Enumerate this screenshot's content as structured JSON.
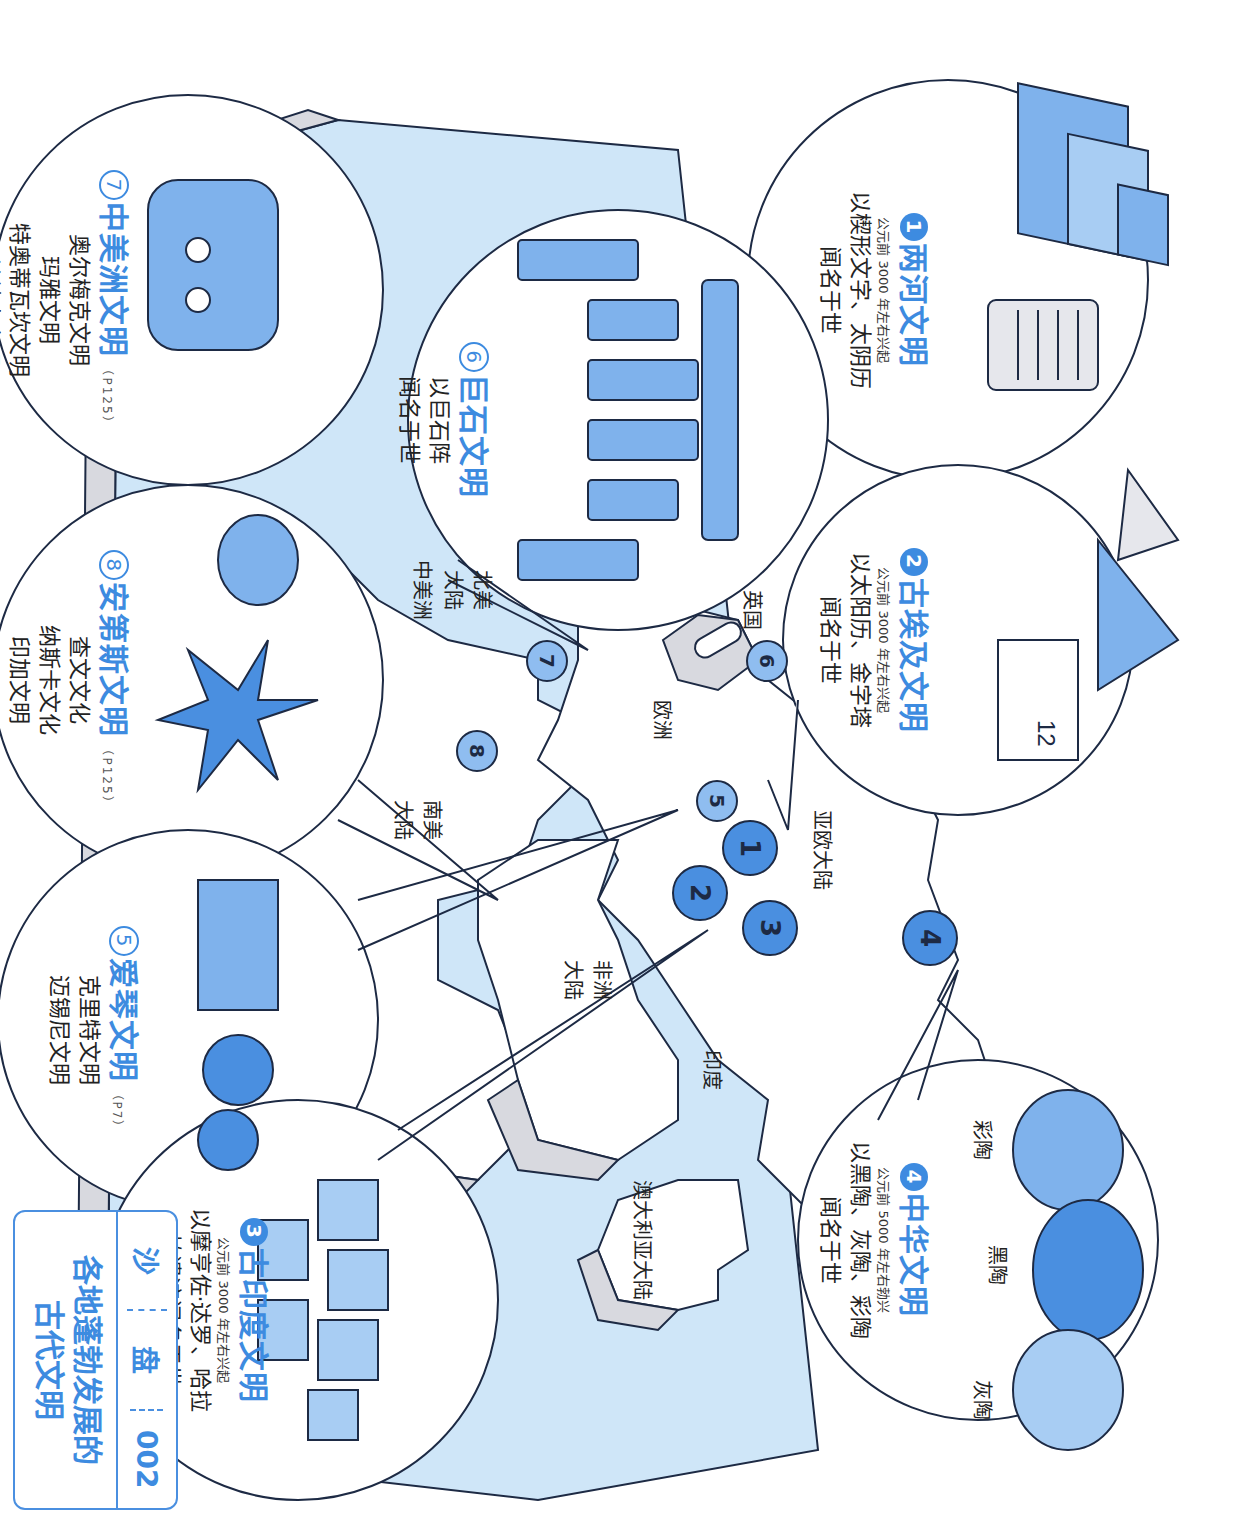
{
  "title_card": {
    "series": [
      "沙",
      "盘",
      "002"
    ],
    "title_line1": "各地蓬勃发展的",
    "title_line2": "古代文明"
  },
  "civilizations": [
    {
      "num": "1",
      "num_style": "filled",
      "name": "两河文明",
      "date": "公元前 3000 年左右兴起",
      "desc": [
        "以楔形文字、太阴历",
        "闻名于世"
      ],
      "ref": ""
    },
    {
      "num": "2",
      "num_style": "filled",
      "name": "古埃及文明",
      "date": "公元前 3000 年左右兴起",
      "desc": [
        "以太阳历、金字塔",
        "闻名于世"
      ],
      "ref": ""
    },
    {
      "num": "3",
      "num_style": "filled",
      "name": "古印度文明",
      "date": "公元前 3000 年左右兴起",
      "desc": [
        "以摩亨佐·达罗、哈拉",
        "帕遗迹闻名于世"
      ],
      "ref": ""
    },
    {
      "num": "4",
      "num_style": "filled",
      "name": "中华文明",
      "date": "公元前 5000 年左右勃兴",
      "desc": [
        "以黑陶、灰陶、彩陶",
        "闻名于世"
      ],
      "ref": "",
      "pottery_labels": [
        "彩陶",
        "黑陶",
        "灰陶"
      ]
    },
    {
      "num": "5",
      "num_style": "ring",
      "name": "爱琴文明",
      "date": "",
      "desc": [
        "克里特文明",
        "迈锡尼文明"
      ],
      "ref": "（P7）"
    },
    {
      "num": "6",
      "num_style": "ring",
      "name": "巨石文明",
      "date": "",
      "desc": [
        "以巨石阵",
        "闻名于世"
      ],
      "ref": ""
    },
    {
      "num": "7",
      "num_style": "ring",
      "name": "中美洲文明",
      "date": "",
      "desc": [
        "奥尔梅克文明",
        "玛雅文明",
        "特奥蒂瓦坎文明",
        "阿兹特克文明"
      ],
      "ref": "（P125）"
    },
    {
      "num": "8",
      "num_style": "ring",
      "name": "安第斯文明",
      "date": "",
      "desc": [
        "查文文化",
        "纳斯卡文化",
        "印加文明"
      ],
      "ref": "（P125）"
    }
  ],
  "map_labels": {
    "eurasia": "亚欧大陆",
    "europe": "欧洲",
    "india": "印度",
    "africa_1": "非洲",
    "africa_2": "大陆",
    "australia": "澳大利亚大陆",
    "north_america_1": "北美",
    "north_america_2": "大陆",
    "central_america": "中美洲",
    "south_america_1": "南美",
    "south_america_2": "大陆",
    "uk": "英国"
  },
  "pins": [
    {
      "num": "1",
      "tone": "dark"
    },
    {
      "num": "2",
      "tone": "dark"
    },
    {
      "num": "3",
      "tone": "dark"
    },
    {
      "num": "4",
      "tone": "dark"
    },
    {
      "num": "5",
      "tone": "light"
    },
    {
      "num": "6",
      "tone": "light"
    },
    {
      "num": "7",
      "tone": "light"
    },
    {
      "num": "8",
      "tone": "light"
    }
  ],
  "colors": {
    "accent": "#3d8be0",
    "sea": "#cfe6f8",
    "land": "#ffffff",
    "cliff": "#d8d9df",
    "outline": "#1d2a44",
    "pin_dark": "#4a8fe0",
    "pin_light": "#8fbdf0",
    "artifact_blue": "#7fb2ec"
  }
}
